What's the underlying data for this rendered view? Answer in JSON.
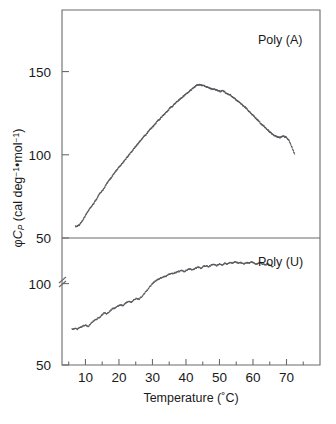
{
  "figure": {
    "background_color": "#ffffff",
    "axis_color": "#6b6b6b",
    "data_color": "#55585c"
  },
  "axes": {
    "x_title": "Temperature (˚C)",
    "y_title_prefix": "φ",
    "y_title_italic": "C",
    "y_title_sub": "P",
    "y_title_rest": " (cal deg",
    "y_title_sup1": "−1",
    "y_title_mid": "•mol",
    "y_title_sup2": "−1",
    "y_title_end": ")",
    "y_title_full": "φCP (cal deg−1•mol−1)",
    "x_ticks": [
      10,
      20,
      30,
      40,
      50,
      60,
      70
    ],
    "x_tick_labels": [
      "10",
      "20",
      "30",
      "40",
      "50",
      "60",
      "70"
    ],
    "x_minor_ticks": [
      5,
      15,
      25,
      35,
      45,
      55,
      65,
      75
    ],
    "x_range": [
      3,
      80
    ],
    "upper_y_ticks": [
      50,
      100,
      150
    ],
    "upper_y_tick_labels": [
      "50",
      "100",
      "150"
    ],
    "upper_y_range": [
      50,
      187
    ],
    "lower_y_ticks": [
      50,
      100
    ],
    "lower_y_tick_labels": [
      "50",
      "100"
    ],
    "lower_y_range": [
      50,
      128
    ],
    "axis_break_on_lower_y": true
  },
  "panels": [
    {
      "id": "upper",
      "label": "Poly (A)"
    },
    {
      "id": "lower",
      "label": "Poly (U)"
    }
  ],
  "chart_data": {
    "type": "scatter",
    "title": "",
    "xlabel": "Temperature (˚C)",
    "ylabel": "φCP (cal deg−1•mol−1)",
    "grid": false,
    "legend": "none",
    "panel_labels": [
      "Poly (A)",
      "Poly (U)"
    ],
    "series": [
      {
        "name": "Poly (A)",
        "panel": "upper",
        "xlim": [
          3,
          80
        ],
        "ylim": [
          50,
          187
        ],
        "x": [
          7.0,
          7.6,
          8.2,
          8.8,
          9.4,
          10.0,
          10.6,
          11.2,
          11.8,
          12.4,
          13.0,
          13.6,
          14.2,
          14.8,
          15.4,
          16.0,
          16.6,
          17.2,
          17.8,
          18.4,
          19.0,
          19.6,
          20.2,
          20.8,
          21.4,
          22.0,
          22.6,
          23.2,
          23.8,
          24.4,
          25.0,
          25.6,
          26.2,
          26.8,
          27.4,
          28.0,
          28.6,
          29.2,
          29.8,
          30.4,
          31.0,
          31.6,
          32.2,
          32.8,
          33.4,
          34.0,
          34.6,
          35.2,
          35.8,
          36.4,
          37.0,
          37.6,
          38.2,
          38.8,
          39.4,
          40.0,
          40.6,
          41.2,
          41.8,
          42.4,
          43.0,
          43.6,
          44.2,
          44.8,
          45.4,
          46.0,
          46.6,
          47.2,
          47.8,
          48.4,
          49.0,
          49.6,
          50.2,
          50.8,
          51.4,
          52.0,
          52.6,
          53.2,
          53.8,
          54.4,
          55.0,
          55.6,
          56.2,
          56.8,
          57.4,
          58.0,
          58.6,
          59.2,
          59.8,
          60.4,
          61.0,
          61.6,
          62.2,
          62.8,
          63.4,
          64.0,
          64.6,
          65.2,
          65.8,
          66.4,
          67.0,
          67.6,
          68.2,
          68.8,
          69.4,
          70.0,
          70.6,
          71.2,
          71.8,
          72.4
        ],
        "y": [
          57.0,
          57.2,
          57.8,
          59.5,
          61.5,
          63.5,
          65.5,
          67.5,
          69.0,
          70.5,
          72.5,
          74.5,
          76.5,
          78.0,
          79.5,
          81.5,
          83.5,
          85.0,
          86.5,
          88.5,
          90.0,
          91.5,
          93.0,
          94.5,
          96.0,
          97.5,
          99.0,
          100.5,
          102.0,
          103.5,
          105.0,
          106.5,
          108.0,
          109.5,
          111.0,
          112.0,
          113.5,
          115.0,
          116.5,
          117.5,
          119.0,
          120.5,
          121.5,
          123.0,
          124.0,
          125.5,
          126.5,
          128.0,
          129.0,
          130.0,
          131.5,
          132.5,
          133.5,
          134.5,
          135.5,
          136.5,
          137.5,
          138.5,
          139.5,
          140.5,
          141.5,
          142.0,
          142.0,
          141.8,
          141.5,
          141.0,
          140.5,
          140.0,
          139.5,
          139.5,
          139.0,
          138.5,
          138.0,
          138.5,
          138.0,
          137.0,
          136.5,
          136.0,
          135.0,
          134.0,
          133.0,
          132.0,
          131.0,
          130.0,
          129.0,
          128.0,
          126.5,
          125.5,
          124.0,
          123.0,
          121.5,
          120.5,
          119.0,
          118.0,
          117.0,
          115.5,
          114.5,
          113.5,
          112.5,
          111.5,
          111.0,
          110.5,
          110.5,
          111.0,
          111.0,
          110.5,
          109.0,
          106.5,
          103.5,
          100.5
        ]
      },
      {
        "name": "Poly (U)",
        "panel": "lower",
        "xlim": [
          3,
          80
        ],
        "ylim": [
          50,
          128
        ],
        "x": [
          6.0,
          6.8,
          7.6,
          8.4,
          9.2,
          10.0,
          10.8,
          11.6,
          12.4,
          13.2,
          14.0,
          14.8,
          15.6,
          16.4,
          17.2,
          18.0,
          18.8,
          19.6,
          20.4,
          21.2,
          22.0,
          22.8,
          23.6,
          24.4,
          25.2,
          26.0,
          26.8,
          27.6,
          28.4,
          29.2,
          30.0,
          30.8,
          31.6,
          32.4,
          33.2,
          34.0,
          34.8,
          35.6,
          36.4,
          37.2,
          38.0,
          38.8,
          39.6,
          40.4,
          41.2,
          42.0,
          42.8,
          43.6,
          44.4,
          45.2,
          46.0,
          46.8,
          47.6,
          48.4,
          49.2,
          50.0,
          50.8,
          51.6,
          52.4,
          53.2,
          54.0,
          54.8,
          55.6,
          56.4,
          57.2,
          58.0,
          58.8,
          59.6,
          60.4,
          61.2,
          62.0,
          62.8,
          63.6,
          64.4,
          65.2,
          66.0
        ],
        "y": [
          72.0,
          72.5,
          72.0,
          73.0,
          74.0,
          74.5,
          73.5,
          75.5,
          77.0,
          78.0,
          79.0,
          80.5,
          82.0,
          81.5,
          83.0,
          84.5,
          85.0,
          86.0,
          87.0,
          86.5,
          88.0,
          89.0,
          88.5,
          90.0,
          91.0,
          90.5,
          92.0,
          94.0,
          96.0,
          98.0,
          100.0,
          101.5,
          102.5,
          103.5,
          104.0,
          104.5,
          105.5,
          106.0,
          106.5,
          107.0,
          107.5,
          108.0,
          107.5,
          108.5,
          109.0,
          108.5,
          109.5,
          110.0,
          109.5,
          110.5,
          111.0,
          110.5,
          111.5,
          112.0,
          111.0,
          112.0,
          111.5,
          112.5,
          112.0,
          113.0,
          112.5,
          113.5,
          112.5,
          113.0,
          112.0,
          113.0,
          112.5,
          113.5,
          112.5,
          112.0,
          113.0,
          112.0,
          111.5,
          112.0,
          111.0,
          110.5
        ]
      }
    ]
  }
}
